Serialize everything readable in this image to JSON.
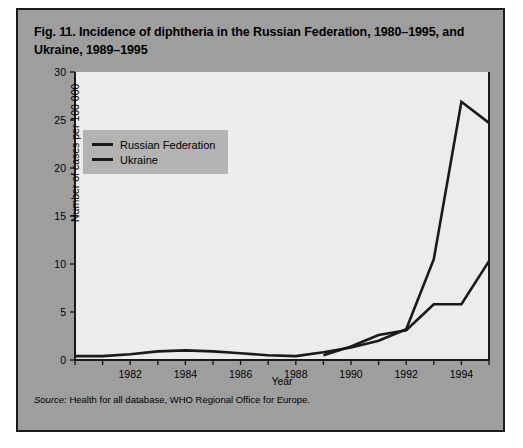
{
  "figure": {
    "title": "Fig. 11. Incidence of diphtheria in the Russian Federation, 1980–1995, and Ukraine, 1989–1995",
    "source_prefix": "Source:",
    "source_text": " Health for all database, WHO Regional Office for Europe.",
    "panel_color": "#9e9e9e",
    "plot_color": "#ececec",
    "line_color": "#1a1a1a",
    "legend_color": "#b3b3b3"
  },
  "legend": {
    "position": "inside-top-left",
    "entries": [
      {
        "label": "Russian Federation"
      },
      {
        "label": "Ukraine"
      }
    ]
  },
  "chart_data": {
    "type": "line",
    "title": "Fig. 11. Incidence of diphtheria in the Russian Federation, 1980–1995, and Ukraine, 1989–1995",
    "xlabel": "Year",
    "ylabel": "Number of cases per 100 000",
    "xlim": [
      1980,
      1995
    ],
    "ylim": [
      0,
      30
    ],
    "yticks": [
      0,
      5,
      10,
      15,
      20,
      25,
      30
    ],
    "ytick_labels": [
      "0",
      "5",
      "10",
      "15",
      "20",
      "25",
      "30"
    ],
    "xticks": [
      1980,
      1981,
      1982,
      1983,
      1984,
      1985,
      1986,
      1987,
      1988,
      1989,
      1990,
      1991,
      1992,
      1993,
      1994,
      1995
    ],
    "xtick_labels_major": [
      {
        "x": 1982,
        "label": "1982"
      },
      {
        "x": 1984,
        "label": "1984"
      },
      {
        "x": 1986,
        "label": "1986"
      },
      {
        "x": 1988,
        "label": "1988"
      },
      {
        "x": 1990,
        "label": "1990"
      },
      {
        "x": 1992,
        "label": "1992"
      },
      {
        "x": 1994,
        "label": "1994"
      }
    ],
    "grid": false,
    "legend": [
      "Russian Federation",
      "Ukraine"
    ],
    "series": [
      {
        "name": "Russian Federation",
        "x": [
          1980,
          1981,
          1982,
          1983,
          1984,
          1985,
          1986,
          1987,
          1988,
          1989,
          1990,
          1991,
          1992,
          1993,
          1994,
          1995
        ],
        "values": [
          0.4,
          0.4,
          0.6,
          0.9,
          1.0,
          0.9,
          0.7,
          0.5,
          0.4,
          0.8,
          1.3,
          2.0,
          3.2,
          10.5,
          26.9,
          24.7
        ]
      },
      {
        "name": "Ukraine",
        "x": [
          1989,
          1990,
          1991,
          1992,
          1993,
          1994,
          1995
        ],
        "values": [
          0.5,
          1.4,
          2.6,
          3.1,
          5.8,
          5.8,
          10.3
        ]
      }
    ]
  }
}
